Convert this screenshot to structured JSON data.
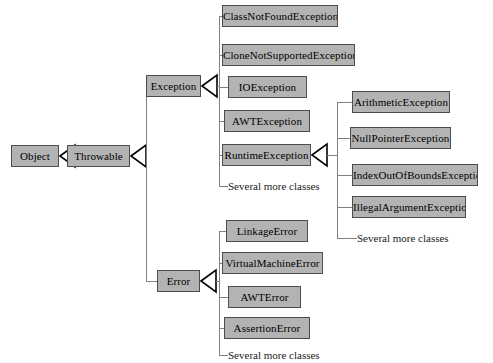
{
  "diagram": {
    "type": "uml-class-hierarchy",
    "background_color": "#ffffff",
    "node_fill_color": "#b3b3b3",
    "node_border_color": "#4d4d4d",
    "edge_color": "#808080",
    "text_color": "#000000"
  },
  "nodes": [
    {
      "id": "object",
      "label": "Object",
      "x": 11,
      "y": 145,
      "w": 48,
      "boxed": true
    },
    {
      "id": "throwable",
      "label": "Throwable",
      "x": 67,
      "y": 145,
      "w": 63,
      "boxed": true
    },
    {
      "id": "exception",
      "label": "Exception",
      "x": 146,
      "y": 75,
      "w": 55,
      "boxed": true
    },
    {
      "id": "error",
      "label": "Error",
      "x": 157,
      "y": 270,
      "w": 43,
      "boxed": true
    },
    {
      "id": "cnfe",
      "label": "ClassNotFoundException",
      "x": 222,
      "y": 5,
      "w": 116,
      "boxed": true
    },
    {
      "id": "cnse",
      "label": "CloneNotSupportedException",
      "x": 222,
      "y": 44,
      "w": 133,
      "boxed": true
    },
    {
      "id": "ioe",
      "label": "IOException",
      "x": 228,
      "y": 76,
      "w": 79,
      "boxed": true
    },
    {
      "id": "awte",
      "label": "AWTException",
      "x": 224,
      "y": 110,
      "w": 86,
      "boxed": true
    },
    {
      "id": "rte",
      "label": "RuntimeException",
      "x": 222,
      "y": 144,
      "w": 89,
      "boxed": true
    },
    {
      "id": "exc_more",
      "label": "Several more classes",
      "x": 228,
      "y": 177,
      "w": 110,
      "boxed": false
    },
    {
      "id": "arith",
      "label": "ArithmeticException",
      "x": 352,
      "y": 91,
      "w": 98,
      "boxed": true
    },
    {
      "id": "npe",
      "label": "NullPointerException",
      "x": 350,
      "y": 127,
      "w": 101,
      "boxed": true
    },
    {
      "id": "ioobe",
      "label": "IndexOutOfBoundsException",
      "x": 352,
      "y": 164,
      "w": 126,
      "boxed": true
    },
    {
      "id": "iae",
      "label": "IllegalArgumentException",
      "x": 352,
      "y": 196,
      "w": 114,
      "boxed": true
    },
    {
      "id": "rte_more",
      "label": "Several more classes",
      "x": 357,
      "y": 229,
      "w": 110,
      "boxed": false
    },
    {
      "id": "linkage",
      "label": "LinkageError",
      "x": 226,
      "y": 220,
      "w": 82,
      "boxed": true
    },
    {
      "id": "vme",
      "label": "VirtualMachineError",
      "x": 222,
      "y": 252,
      "w": 101,
      "boxed": true
    },
    {
      "id": "awterr",
      "label": "AWTError",
      "x": 228,
      "y": 286,
      "w": 73,
      "boxed": true
    },
    {
      "id": "asserterr",
      "label": "AssertionError",
      "x": 224,
      "y": 317,
      "w": 86,
      "boxed": true
    },
    {
      "id": "err_more",
      "label": "Several more classes",
      "x": 228,
      "y": 346,
      "w": 110,
      "boxed": false
    }
  ],
  "edges": [
    {
      "from": "throwable",
      "to": "object",
      "kind": "generalization"
    },
    {
      "from": "exception",
      "to": "throwable",
      "kind": "generalization"
    },
    {
      "from": "error",
      "to": "throwable",
      "kind": "generalization"
    },
    {
      "from": "cnfe",
      "to": "exception",
      "kind": "generalization"
    },
    {
      "from": "cnse",
      "to": "exception",
      "kind": "generalization"
    },
    {
      "from": "ioe",
      "to": "exception",
      "kind": "generalization"
    },
    {
      "from": "awte",
      "to": "exception",
      "kind": "generalization"
    },
    {
      "from": "rte",
      "to": "exception",
      "kind": "generalization"
    },
    {
      "from": "exc_more",
      "to": "exception",
      "kind": "generalization"
    },
    {
      "from": "arith",
      "to": "rte",
      "kind": "generalization"
    },
    {
      "from": "npe",
      "to": "rte",
      "kind": "generalization"
    },
    {
      "from": "ioobe",
      "to": "rte",
      "kind": "generalization"
    },
    {
      "from": "iae",
      "to": "rte",
      "kind": "generalization"
    },
    {
      "from": "rte_more",
      "to": "rte",
      "kind": "generalization"
    },
    {
      "from": "linkage",
      "to": "error",
      "kind": "generalization"
    },
    {
      "from": "vme",
      "to": "error",
      "kind": "generalization"
    },
    {
      "from": "awterr",
      "to": "error",
      "kind": "generalization"
    },
    {
      "from": "asserterr",
      "to": "error",
      "kind": "generalization"
    },
    {
      "from": "err_more",
      "to": "error",
      "kind": "generalization"
    }
  ]
}
